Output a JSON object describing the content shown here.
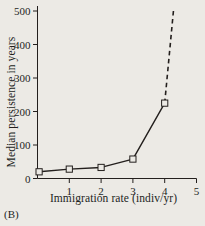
{
  "panel": {
    "label": "(B)"
  },
  "chart_data": {
    "type": "line",
    "title": "",
    "xlabel": "Immigration rate (indiv/yr)",
    "ylabel": "Median persistence in years",
    "xlim": [
      0,
      5
    ],
    "ylim": [
      0,
      500
    ],
    "xticks": [
      0,
      1,
      2,
      3,
      4,
      5
    ],
    "xticklabels": [
      "0",
      "1",
      "2",
      "3",
      "4",
      "5"
    ],
    "yticks": [
      0,
      100,
      200,
      300,
      400,
      500
    ],
    "yticklabels": [
      "0",
      "100",
      "200",
      "300",
      "400",
      "500"
    ],
    "grid": false,
    "legend": null,
    "marker": "open-square",
    "line_color": "#231f1d",
    "marker_face_color": "#eceae5",
    "background_color": "#eceae5",
    "series": [
      {
        "name": "median persistence",
        "style": "solid",
        "x": [
          0.05,
          1,
          2,
          3,
          4
        ],
        "y": [
          20,
          28,
          33,
          58,
          225
        ]
      },
      {
        "name": "extrapolation",
        "style": "dashed",
        "x": [
          4,
          4.28
        ],
        "y": [
          225,
          505
        ]
      }
    ]
  }
}
